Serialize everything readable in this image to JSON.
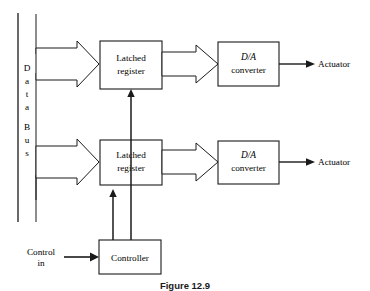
{
  "figure": {
    "caption": "Figure 12.9",
    "background_color": "#ffffff",
    "line_color": "#1a1a1a"
  },
  "bus": {
    "label_letters": [
      "D",
      "a",
      "t",
      "a",
      "B",
      "u",
      "s"
    ],
    "label_full": "Data Bus",
    "name": "data-bus"
  },
  "blocks": {
    "latched_register_top": {
      "line1": "Latched",
      "line2": "register"
    },
    "latched_register_bottom": {
      "line1": "Latched",
      "line2": "register"
    },
    "dac_top": {
      "line1": "D/A",
      "line2": "converter"
    },
    "dac_bottom": {
      "line1": "D/A",
      "line2": "converter"
    },
    "controller": {
      "label": "Controller"
    }
  },
  "labels": {
    "actuator_top": "Actuator",
    "actuator_bottom": "Actuator",
    "control_in_line1": "Control",
    "control_in_line2": "in"
  }
}
